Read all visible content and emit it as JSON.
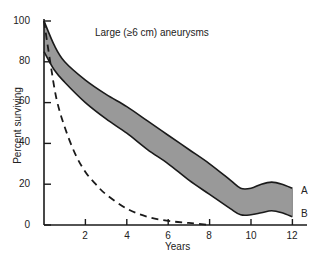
{
  "chart_data": {
    "type": "line",
    "title": "Large (≥6 cm) aneurysms",
    "xlabel": "Years",
    "ylabel": "Percent surviving",
    "xlim": [
      0,
      12.5
    ],
    "ylim": [
      0,
      100
    ],
    "x_ticks": [
      2,
      4,
      6,
      8,
      10,
      12
    ],
    "y_ticks": [
      0,
      20,
      40,
      60,
      80,
      100
    ],
    "grid": false,
    "series": [
      {
        "name": "A",
        "style": "solid, upper bound of shaded band",
        "x": [
          0,
          0.5,
          1,
          2,
          3,
          4,
          5,
          6,
          7,
          8,
          9,
          9.5,
          10,
          10.5,
          11,
          11.5,
          12
        ],
        "values": [
          100,
          88,
          80,
          71,
          64,
          58,
          51,
          44,
          37,
          30,
          22,
          18,
          18,
          20,
          21,
          20,
          18
        ]
      },
      {
        "name": "B",
        "style": "solid, lower bound of shaded band",
        "x": [
          0,
          0.5,
          1,
          2,
          3,
          4,
          5,
          6,
          7,
          8,
          9,
          9.5,
          10,
          10.5,
          11,
          11.5,
          12
        ],
        "values": [
          85,
          76,
          70,
          60,
          52,
          45,
          37,
          30,
          22,
          15,
          8,
          5,
          5,
          6,
          7,
          6,
          4
        ]
      },
      {
        "name": "Dashed (untreated)",
        "style": "dashed",
        "x": [
          0,
          0.3,
          0.6,
          1,
          1.5,
          2,
          2.5,
          3,
          4,
          5,
          6,
          7,
          8
        ],
        "values": [
          100,
          80,
          62,
          48,
          35,
          26,
          20,
          15,
          8,
          4,
          2,
          1,
          0
        ]
      }
    ],
    "band": {
      "between": [
        "A",
        "B"
      ],
      "fill": "#999999"
    }
  },
  "labels": {
    "title": "Large (≥6 cm) aneurysms",
    "xlabel": "Years",
    "ylabel": "Percent surviving",
    "series_a": "A",
    "series_b": "B",
    "yticks": [
      "100",
      "80",
      "60",
      "40",
      "20",
      "0"
    ],
    "xticks": [
      "2",
      "4",
      "6",
      "8",
      "10",
      "12"
    ]
  }
}
